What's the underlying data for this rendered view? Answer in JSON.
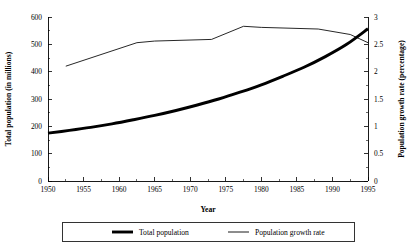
{
  "chart_data": {
    "type": "line",
    "title": "",
    "xlabel": "Year",
    "ylabel": "Total population (in millions)",
    "y2label": "Population growth rate (percentage)",
    "grid": false,
    "legend_position": "bottom",
    "xlim": [
      1950,
      1995
    ],
    "ylim": [
      0,
      600
    ],
    "y2lim": [
      0,
      3
    ],
    "x_ticks": [
      1950,
      1955,
      1960,
      1965,
      1970,
      1975,
      1980,
      1985,
      1990,
      1995
    ],
    "x_tick_labels": [
      "1950",
      "1955",
      "1960",
      "1965",
      "1970",
      "1975",
      "1980",
      "1985",
      "1990",
      "1995"
    ],
    "y_ticks": [
      0,
      100,
      200,
      300,
      400,
      500,
      600
    ],
    "y_tick_labels": [
      "0",
      "100",
      "200",
      "300",
      "400",
      "500",
      "600"
    ],
    "y2_ticks": [
      0,
      0.5,
      1,
      1.5,
      2,
      2.5,
      3
    ],
    "y2_tick_labels": [
      "0",
      "0.5",
      "1",
      "1.5",
      "2",
      "2.5",
      "3"
    ],
    "series": [
      {
        "name": "Total population",
        "axis": "left",
        "unit": "millions",
        "style": "thick",
        "x": [
          1950,
          1953,
          1956,
          1959,
          1962,
          1965,
          1968,
          1971,
          1974,
          1977,
          1980,
          1983,
          1986,
          1989,
          1992,
          1995
        ],
        "values": [
          175,
          185,
          196,
          209,
          224,
          240,
          258,
          278,
          300,
          325,
          352,
          383,
          416,
          455,
          500,
          557
        ]
      },
      {
        "name": "Population growth rate",
        "axis": "right",
        "unit": "percentage",
        "style": "thin",
        "x": [
          1952.5,
          1962.5,
          1965,
          1973,
          1977.5,
          1980,
          1988,
          1992.5,
          1995
        ],
        "values": [
          2.1,
          2.53,
          2.56,
          2.59,
          2.83,
          2.81,
          2.78,
          2.68,
          2.53
        ]
      }
    ],
    "legend": [
      {
        "label": "Total population",
        "style": "thick"
      },
      {
        "label": "Population growth rate",
        "style": "thin"
      }
    ],
    "colors": {
      "series_line": "#000000",
      "axis": "#000000",
      "background": "#ffffff"
    }
  }
}
